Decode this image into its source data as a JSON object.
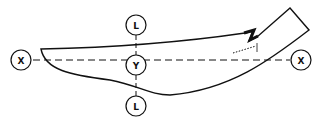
{
  "diagram": {
    "type": "technical-profile",
    "stroke_color": "#111111",
    "background": "#ffffff",
    "labels": {
      "x_left": "X",
      "x_right": "X",
      "y_center": "Y",
      "l_top": "L",
      "l_bottom": "L"
    },
    "axes": [
      {
        "name": "X-X",
        "style": "dashed",
        "orientation": "horizontal"
      },
      {
        "name": "L-L",
        "style": "dashed",
        "orientation": "vertical"
      }
    ]
  }
}
